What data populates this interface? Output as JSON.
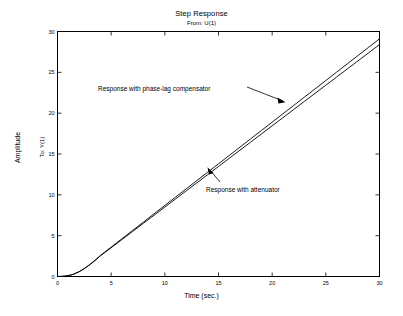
{
  "figure": {
    "title": "Step Response",
    "subtitle": "From: U(1)",
    "background_color": "#ffffff",
    "line_color": "#000000",
    "axis_color": "#000000"
  },
  "axes": {
    "xlabel": "Time (sec.)",
    "ylabel_outer": "Amplitude",
    "ylabel_inner": "To: Y(1)",
    "xticks": [
      "0",
      "5",
      "10",
      "15",
      "20",
      "25",
      "30"
    ],
    "yticks": [
      "0",
      "5",
      "10",
      "15",
      "20",
      "25",
      "30"
    ]
  },
  "annotations": [
    {
      "id": "compensator",
      "text": "Response with phase-lag compensator"
    },
    {
      "id": "attenuator",
      "text": "Response with attenuator"
    }
  ],
  "chart_data": {
    "type": "line",
    "title": "Step Response",
    "subtitle": "From: U(1)",
    "xlabel": "Time (sec.)",
    "ylabel": "Amplitude",
    "ylabel_inner": "To: Y(1)",
    "xlim": [
      0,
      30
    ],
    "ylim": [
      0,
      30
    ],
    "xticks": [
      0,
      5,
      10,
      15,
      20,
      25,
      30
    ],
    "yticks": [
      0,
      5,
      10,
      15,
      20,
      25,
      30
    ],
    "grid": false,
    "legend": "none",
    "annotations": [
      {
        "text": "Response with phase-lag compensator",
        "text_xy": [
          5.6,
          22.8
        ],
        "arrow_tip_xy": [
          22.0,
          21.0
        ]
      },
      {
        "text": "Response with attenuator",
        "text_xy": [
          15.6,
          10.6
        ],
        "arrow_tip_xy": [
          14.6,
          13.6
        ]
      }
    ],
    "x": [
      0,
      0.5,
      1,
      1.5,
      2,
      2.5,
      3,
      3.5,
      4,
      5,
      6,
      7,
      8,
      9,
      10,
      11,
      12,
      13,
      14,
      15,
      16,
      17,
      18,
      19,
      20,
      21,
      22,
      23,
      24,
      25,
      26,
      27,
      28,
      29,
      30
    ],
    "series": [
      {
        "name": "Response with phase-lag compensator",
        "values": [
          0,
          0.02,
          0.1,
          0.28,
          0.58,
          0.98,
          1.46,
          2.0,
          2.58,
          3.85,
          5.18,
          6.55,
          7.93,
          9.33,
          10.73,
          12.14,
          13.55,
          14.96,
          16.38,
          17.8,
          19.22,
          20.64,
          22.06,
          23.48,
          24.9,
          26.32,
          27.74,
          29.16,
          30.58,
          32.0,
          33.42,
          34.84,
          36.26,
          37.68,
          29.1
        ]
      },
      {
        "name": "Response with attenuator",
        "values": [
          0,
          0.02,
          0.1,
          0.28,
          0.57,
          0.96,
          1.43,
          1.96,
          2.53,
          3.77,
          5.07,
          6.41,
          7.76,
          9.12,
          10.49,
          11.86,
          13.23,
          14.6,
          15.98,
          17.35,
          18.73,
          20.11,
          21.48,
          22.86,
          24.24,
          25.61,
          26.99,
          28.37,
          29.74,
          31.12,
          32.5,
          33.87,
          35.25,
          36.63,
          28.4
        ]
      }
    ]
  }
}
